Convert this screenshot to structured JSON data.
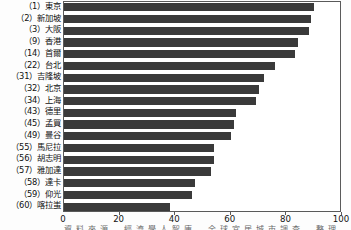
{
  "chart_data": {
    "type": "bar",
    "orientation": "horizontal",
    "title": "",
    "subtitle": "",
    "xlabel": "",
    "ylabel": "",
    "xlim": [
      0,
      100
    ],
    "ylim": null,
    "grid": false,
    "legend": null,
    "xticks": [
      0,
      20,
      40,
      60,
      80,
      100
    ],
    "xtick_labels": [
      "0",
      "20",
      "40",
      "60",
      "80",
      "100"
    ],
    "bar_color": "#3a3a3a",
    "categories": [
      "（1）東京",
      "（2）新加坡",
      "（3）大阪",
      "（9）香港",
      "（14）首爾",
      "（22）台北",
      "（31）吉隆坡",
      "（32）北京",
      "（34）上海",
      "（43）德里",
      "（45）孟買",
      "（49）曼谷",
      "（55）馬尼拉",
      "（56）胡志明",
      "（57）雅加達",
      "（58）達卡",
      "（59）仰光",
      "（60）喀拉蚩"
    ],
    "values": [
      90,
      89,
      88,
      84,
      83,
      76,
      72,
      70,
      69,
      62,
      61,
      60,
      54,
      54,
      53,
      47,
      46,
      38
    ]
  },
  "caption": {
    "text": "資料來源　經濟學人智庫　全球宜居城市調查　整理　製表"
  },
  "colors": {
    "bar": "#3a3a3a",
    "frame": "#5a5a5a",
    "text": "#111111",
    "background": "#ffffff"
  }
}
